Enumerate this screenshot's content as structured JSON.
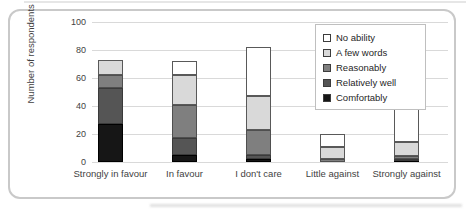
{
  "chart_data": {
    "type": "bar",
    "stacked": true,
    "title": "",
    "xlabel": "",
    "ylabel": "Number of respondents",
    "ylim": [
      0,
      100
    ],
    "ytick_step": 20,
    "grid": "horizontal",
    "grid_color": "#d9d9d9",
    "legend_position": "top-right-inside",
    "categories": [
      "Strongly in favour",
      "In favour",
      "I don't care",
      "Little against",
      "Strongly against"
    ],
    "series": [
      {
        "name": "Comfortably",
        "color": "#161616",
        "border": "#000000",
        "values": [
          27,
          5,
          2,
          0,
          1
        ]
      },
      {
        "name": "Relatively well",
        "color": "#555555",
        "border": "#3a3a3a",
        "values": [
          26,
          12,
          3,
          0,
          1
        ]
      },
      {
        "name": "Reasonably",
        "color": "#7f7f7f",
        "border": "#4f4f4f",
        "values": [
          9,
          24,
          18,
          2,
          2
        ]
      },
      {
        "name": "A few words",
        "color": "#d9d9d9",
        "border": "#595959",
        "values": [
          11,
          21,
          24,
          9,
          10
        ]
      },
      {
        "name": "No ability",
        "color": "#ffffff",
        "border": "#595959",
        "values": [
          0,
          10,
          35,
          9,
          26
        ]
      }
    ],
    "legend_order_top_to_bottom": [
      "No ability",
      "A few words",
      "Reasonably",
      "Relatively well",
      "Comfortably"
    ],
    "bar_totals": [
      73,
      72,
      82,
      20,
      40
    ]
  }
}
